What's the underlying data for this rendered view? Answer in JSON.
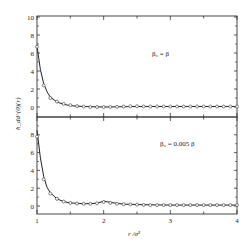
{
  "chart_data": {
    "type": "line",
    "layout": "two vertically stacked panels sharing x axis",
    "xlabel": "r /σ³",
    "ylabel": "h_dd^(0)(r)",
    "xlim": [
      1,
      4
    ],
    "x_ticks": [
      "1",
      "2",
      "3",
      "4"
    ],
    "grid": false,
    "legend": "none (panel annotations)",
    "panels": [
      {
        "annotation": "β₀ = β",
        "ylim": [
          -1,
          10
        ],
        "y_ticks": [
          "0",
          "2",
          "4",
          "6",
          "8",
          "10"
        ],
        "series": [
          {
            "name": "theory (solid line)",
            "style": "line",
            "x": [
              1.0,
              1.05,
              1.1,
              1.15,
              1.2,
              1.3,
              1.4,
              1.5,
              1.7,
              2.0,
              2.5,
              3.0,
              3.5,
              4.0
            ],
            "values": [
              6.8,
              4.2,
              2.6,
              1.7,
              1.1,
              0.55,
              0.3,
              0.15,
              0.05,
              0.0,
              0.05,
              0.05,
              0.05,
              0.05
            ]
          },
          {
            "name": "simulation (open circles)",
            "style": "markers",
            "x": [
              1.0,
              1.1,
              1.2,
              1.3,
              1.4,
              1.5,
              1.6,
              1.7,
              1.8,
              1.9,
              2.0,
              2.1,
              2.2,
              2.3,
              2.4,
              2.5,
              2.6,
              2.7,
              2.8,
              2.9,
              3.0,
              3.1,
              3.2,
              3.3,
              3.4,
              3.5,
              3.6,
              3.7,
              3.8,
              3.9,
              4.0
            ],
            "values": [
              6.7,
              2.4,
              1.0,
              0.6,
              0.35,
              0.2,
              0.1,
              0.05,
              0.0,
              0.0,
              0.0,
              0.0,
              0.02,
              0.05,
              0.08,
              0.08,
              0.06,
              0.05,
              0.05,
              0.05,
              0.05,
              0.05,
              0.05,
              0.05,
              0.05,
              0.05,
              0.05,
              0.05,
              0.05,
              0.05,
              0.05
            ]
          }
        ]
      },
      {
        "annotation": "β₀ = 0.005 β",
        "ylim": [
          -1,
          10
        ],
        "y_ticks": [
          "0",
          "2",
          "4",
          "6",
          "8"
        ],
        "series": [
          {
            "name": "theory (solid line)",
            "style": "line",
            "x": [
              1.0,
              1.05,
              1.1,
              1.15,
              1.2,
              1.3,
              1.4,
              1.5,
              1.7,
              1.9,
              2.0,
              2.1,
              2.3,
              2.6,
              3.0,
              3.5,
              4.0
            ],
            "values": [
              8.5,
              5.5,
              3.3,
              2.1,
              1.5,
              0.8,
              0.5,
              0.35,
              0.25,
              0.3,
              0.55,
              0.4,
              0.2,
              0.15,
              0.1,
              0.1,
              0.1
            ]
          },
          {
            "name": "simulation (open circles)",
            "style": "markers",
            "x": [
              1.0,
              1.1,
              1.2,
              1.3,
              1.4,
              1.5,
              1.6,
              1.7,
              1.8,
              1.9,
              2.0,
              2.1,
              2.2,
              2.3,
              2.4,
              2.5,
              2.6,
              2.7,
              2.8,
              2.9,
              3.0,
              3.1,
              3.2,
              3.3,
              3.4,
              3.5,
              3.6,
              3.7,
              3.8,
              3.9,
              4.0
            ],
            "values": [
              7.8,
              3.0,
              1.4,
              0.8,
              0.5,
              0.35,
              0.28,
              0.25,
              0.25,
              0.3,
              0.45,
              0.35,
              0.25,
              0.2,
              0.18,
              0.15,
              0.12,
              0.1,
              0.1,
              0.1,
              0.1,
              0.1,
              0.1,
              0.1,
              0.1,
              0.1,
              0.1,
              0.1,
              0.1,
              0.1,
              0.1
            ]
          }
        ]
      }
    ]
  }
}
